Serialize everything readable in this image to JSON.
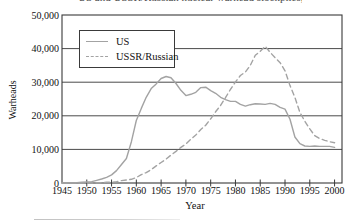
{
  "page": {
    "clipped_title": "US and USSR/Russian nuclear warhead stockpiles, 1945-2000"
  },
  "colors": {
    "frame": "#3a3a3a",
    "grid": "#4a4a4a",
    "series_gray": "#a3a3a3",
    "text": "#111111",
    "legend_border": "#3a3a3a",
    "background": "#ffffff"
  },
  "chart_data": {
    "type": "line",
    "title": "",
    "xlabel": "Year",
    "ylabel": "Warheads",
    "xlim": [
      1945,
      2001.5
    ],
    "ylim": [
      0,
      50000
    ],
    "x_ticks": [
      1945,
      1950,
      1955,
      1960,
      1965,
      1970,
      1975,
      1980,
      1985,
      1990,
      1995,
      2000
    ],
    "y_ticks": [
      0,
      10000,
      20000,
      30000,
      40000,
      50000
    ],
    "y_tick_labels": [
      "0",
      "10,000",
      "20,000",
      "30,000",
      "40,000",
      "50,000"
    ],
    "grid": "horizontal",
    "legend_position": "top-left",
    "series": [
      {
        "name": "US",
        "style": "solid",
        "color": "#a3a3a3",
        "x": [
          1945,
          1946,
          1947,
          1948,
          1949,
          1950,
          1951,
          1952,
          1953,
          1954,
          1955,
          1956,
          1957,
          1958,
          1959,
          1960,
          1961,
          1962,
          1963,
          1964,
          1965,
          1966,
          1967,
          1968,
          1969,
          1970,
          1971,
          1972,
          1973,
          1974,
          1975,
          1976,
          1977,
          1978,
          1979,
          1980,
          1981,
          1982,
          1983,
          1984,
          1985,
          1986,
          1987,
          1988,
          1989,
          1990,
          1991,
          1992,
          1993,
          1994,
          1995,
          1996,
          1997,
          1998,
          1999,
          2000
        ],
        "y": [
          0,
          0,
          100,
          100,
          200,
          300,
          400,
          800,
          1200,
          1700,
          2400,
          3700,
          5500,
          7300,
          12300,
          18600,
          22200,
          25500,
          28100,
          29500,
          31100,
          31700,
          31300,
          29600,
          27600,
          26000,
          26400,
          27000,
          28400,
          28500,
          27500,
          26700,
          25500,
          24800,
          24300,
          24300,
          23400,
          22900,
          23300,
          23600,
          23500,
          23400,
          23700,
          23400,
          22500,
          22000,
          19000,
          13700,
          11700,
          11000,
          10900,
          11000,
          10900,
          10900,
          10900,
          10600
        ]
      },
      {
        "name": "USSR/Russian",
        "style": "dashed",
        "color": "#a3a3a3",
        "x": [
          1945,
          1946,
          1947,
          1948,
          1949,
          1950,
          1951,
          1952,
          1953,
          1954,
          1955,
          1956,
          1957,
          1958,
          1959,
          1960,
          1961,
          1962,
          1963,
          1964,
          1965,
          1966,
          1967,
          1968,
          1969,
          1970,
          1971,
          1972,
          1973,
          1974,
          1975,
          1976,
          1977,
          1978,
          1979,
          1980,
          1981,
          1982,
          1983,
          1984,
          1985,
          1986,
          1987,
          1988,
          1989,
          1990,
          1991,
          1992,
          1993,
          1994,
          1995,
          1996,
          1997,
          1998,
          1999,
          2000
        ],
        "y": [
          0,
          0,
          0,
          0,
          0,
          0,
          0,
          100,
          100,
          200,
          200,
          400,
          700,
          900,
          1100,
          1600,
          2500,
          3100,
          4000,
          5100,
          6100,
          7100,
          8300,
          9400,
          10600,
          11600,
          13000,
          14300,
          15900,
          17200,
          19100,
          21200,
          23100,
          25400,
          27900,
          30100,
          32000,
          33000,
          35000,
          38000,
          39200,
          40700,
          38900,
          37300,
          35800,
          33400,
          29000,
          25500,
          21000,
          18400,
          16100,
          14100,
          13200,
          12700,
          12300,
          12000
        ]
      }
    ]
  }
}
